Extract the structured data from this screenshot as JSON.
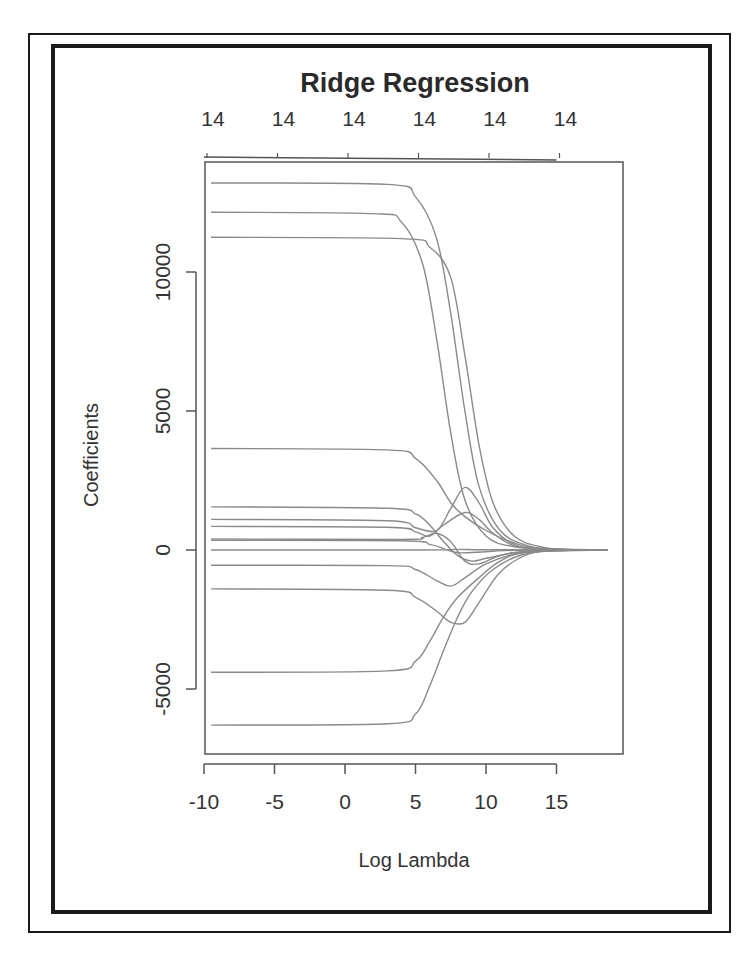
{
  "chart_data": {
    "type": "line",
    "title": "Ridge Regression",
    "xlabel": "Log Lambda",
    "ylabel": "Coefficients",
    "xlim": [
      -10,
      19.2
    ],
    "ylim": [
      -7000,
      13800
    ],
    "grid": false,
    "legend": null,
    "x_ticks": [
      -10,
      -5,
      0,
      5,
      10,
      15
    ],
    "x_tick_labels": [
      "-10",
      "-5",
      "0",
      "5",
      "10",
      "15"
    ],
    "y_ticks": [
      -5000,
      0,
      5000,
      10000
    ],
    "y_tick_labels": [
      "-5000",
      "0",
      "5000",
      "10000"
    ],
    "top_axis": {
      "label": "degrees of freedom (number of nonzero coefficients)",
      "ticks": [
        -10,
        -5,
        0,
        5,
        10,
        15
      ],
      "tick_labels": [
        "14",
        "14",
        "14",
        "14",
        "14",
        "14"
      ]
    },
    "series": [
      {
        "name": "coef_1",
        "points": [
          [
            -9.5,
            13200
          ],
          [
            3,
            13150
          ],
          [
            5,
            12700
          ],
          [
            6.5,
            11200
          ],
          [
            7.5,
            8500
          ],
          [
            8.5,
            5000
          ],
          [
            9.5,
            2300
          ],
          [
            11,
            700
          ],
          [
            13,
            150
          ],
          [
            15,
            20
          ],
          [
            18.6,
            0
          ]
        ]
      },
      {
        "name": "coef_2",
        "points": [
          [
            -9.5,
            12150
          ],
          [
            2,
            12100
          ],
          [
            4,
            11800
          ],
          [
            5.5,
            10300
          ],
          [
            6.5,
            7600
          ],
          [
            7.5,
            4200
          ],
          [
            8.5,
            1800
          ],
          [
            10,
            500
          ],
          [
            12,
            120
          ],
          [
            15,
            15
          ],
          [
            18.6,
            0
          ]
        ]
      },
      {
        "name": "coef_3",
        "points": [
          [
            -9.5,
            11250
          ],
          [
            4,
            11200
          ],
          [
            6,
            10900
          ],
          [
            7.5,
            9800
          ],
          [
            8.5,
            7000
          ],
          [
            9.5,
            3800
          ],
          [
            10.5,
            1700
          ],
          [
            12,
            500
          ],
          [
            14,
            100
          ],
          [
            16,
            10
          ],
          [
            18.6,
            0
          ]
        ]
      },
      {
        "name": "coef_4",
        "points": [
          [
            -9.5,
            3650
          ],
          [
            3,
            3600
          ],
          [
            5,
            3300
          ],
          [
            6.5,
            2500
          ],
          [
            7.5,
            1700
          ],
          [
            8.5,
            1200
          ],
          [
            10,
            700
          ],
          [
            12,
            250
          ],
          [
            14,
            60
          ],
          [
            18.6,
            0
          ]
        ]
      },
      {
        "name": "coef_5",
        "points": [
          [
            -9.5,
            1550
          ],
          [
            3,
            1500
          ],
          [
            5,
            1300
          ],
          [
            6,
            900
          ],
          [
            7,
            300
          ],
          [
            8,
            -200
          ],
          [
            9,
            -400
          ],
          [
            10,
            -300
          ],
          [
            12,
            -100
          ],
          [
            14,
            -20
          ],
          [
            18.6,
            0
          ]
        ]
      },
      {
        "name": "coef_6",
        "points": [
          [
            -9.5,
            1100
          ],
          [
            3,
            1050
          ],
          [
            5,
            800
          ],
          [
            6.5,
            700
          ],
          [
            7.5,
            1500
          ],
          [
            8.5,
            2250
          ],
          [
            9.5,
            1700
          ],
          [
            10.5,
            800
          ],
          [
            12,
            200
          ],
          [
            14,
            40
          ],
          [
            18.6,
            0
          ]
        ]
      },
      {
        "name": "coef_7",
        "points": [
          [
            -9.5,
            850
          ],
          [
            3,
            820
          ],
          [
            5,
            650
          ],
          [
            6,
            500
          ],
          [
            7,
            900
          ],
          [
            8.5,
            1350
          ],
          [
            9.5,
            1100
          ],
          [
            10.5,
            600
          ],
          [
            12,
            150
          ],
          [
            14,
            30
          ],
          [
            18.6,
            0
          ]
        ]
      },
      {
        "name": "coef_8",
        "points": [
          [
            -9.5,
            400
          ],
          [
            4,
            380
          ],
          [
            5.5,
            450
          ],
          [
            6.5,
            600
          ],
          [
            7.5,
            300
          ],
          [
            8.5,
            -400
          ],
          [
            9.5,
            -500
          ],
          [
            11,
            -200
          ],
          [
            13,
            -40
          ],
          [
            18.6,
            0
          ]
        ]
      },
      {
        "name": "coef_9",
        "points": [
          [
            -9.5,
            350
          ],
          [
            4,
            330
          ],
          [
            6,
            200
          ],
          [
            7,
            50
          ],
          [
            8,
            -100
          ],
          [
            10,
            -60
          ],
          [
            12,
            -10
          ],
          [
            18.6,
            0
          ]
        ]
      },
      {
        "name": "coef_10",
        "points": [
          [
            -9.5,
            0
          ],
          [
            5,
            0
          ],
          [
            8,
            20
          ],
          [
            10,
            10
          ],
          [
            18.6,
            0
          ]
        ]
      },
      {
        "name": "coef_11",
        "points": [
          [
            -9.5,
            -550
          ],
          [
            3,
            -560
          ],
          [
            5,
            -700
          ],
          [
            6.5,
            -1100
          ],
          [
            7.5,
            -1300
          ],
          [
            8.5,
            -1000
          ],
          [
            10,
            -500
          ],
          [
            12,
            -150
          ],
          [
            14,
            -30
          ],
          [
            18.6,
            0
          ]
        ]
      },
      {
        "name": "coef_12",
        "points": [
          [
            -9.5,
            -1400
          ],
          [
            3,
            -1450
          ],
          [
            5,
            -1700
          ],
          [
            6.5,
            -2200
          ],
          [
            7.5,
            -2600
          ],
          [
            8.5,
            -2600
          ],
          [
            9.5,
            -1900
          ],
          [
            11,
            -800
          ],
          [
            13,
            -150
          ],
          [
            15,
            -20
          ],
          [
            18.6,
            0
          ]
        ]
      },
      {
        "name": "coef_13",
        "points": [
          [
            -9.5,
            -4400
          ],
          [
            3,
            -4350
          ],
          [
            5,
            -4000
          ],
          [
            6,
            -3300
          ],
          [
            7,
            -2400
          ],
          [
            8,
            -1700
          ],
          [
            9.5,
            -1000
          ],
          [
            11,
            -400
          ],
          [
            13,
            -80
          ],
          [
            18.6,
            0
          ]
        ]
      },
      {
        "name": "coef_14",
        "points": [
          [
            -9.5,
            -6300
          ],
          [
            3,
            -6250
          ],
          [
            5,
            -5900
          ],
          [
            6,
            -4900
          ],
          [
            7,
            -3600
          ],
          [
            8,
            -2400
          ],
          [
            9,
            -1500
          ],
          [
            10.5,
            -700
          ],
          [
            12.5,
            -180
          ],
          [
            15,
            -20
          ],
          [
            18.6,
            0
          ]
        ]
      }
    ]
  },
  "page": {
    "book_text_fragment": "…ping the algorithm to fit a ridge regression…"
  }
}
